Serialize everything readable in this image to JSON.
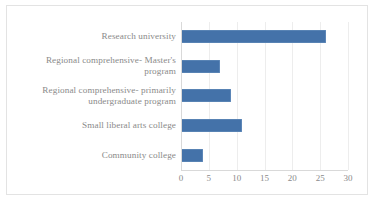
{
  "chart_data": {
    "type": "bar",
    "orientation": "horizontal",
    "title": "",
    "subtitle": "",
    "xlabel": "",
    "ylabel": "",
    "categories": [
      "Research university",
      "Regional comprehensive- Master's program",
      "Regional comprehensive- primarily undergraduate program",
      "Small liberal arts college",
      "Community college"
    ],
    "values": [
      26,
      7,
      9,
      11,
      4
    ],
    "xlim": [
      0,
      30
    ],
    "xticks": [
      0,
      5,
      10,
      15,
      20,
      25,
      30
    ],
    "xtick_labels": [
      "0",
      "5",
      "10",
      "15",
      "20",
      "25",
      "30"
    ],
    "grid": "vertical",
    "legend": "none",
    "series": [
      {
        "name": "",
        "values": [
          26,
          7,
          9,
          11,
          4
        ],
        "color": "#4472a9"
      }
    ]
  },
  "colors": {
    "bar": "#4472a9",
    "bar_edge": "#6d93c0",
    "text": "#8a8a8a",
    "gridline": "#ededed",
    "axis": "#d9d9d9",
    "border": "#e3e3e3",
    "background": "#ffffff"
  }
}
